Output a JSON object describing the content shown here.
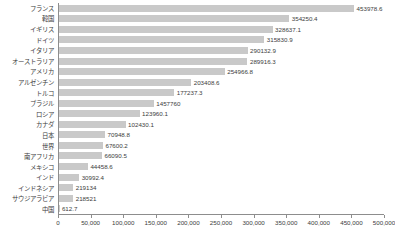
{
  "chart_data": {
    "type": "bar",
    "orientation": "horizontal",
    "title": "",
    "subtitle": "",
    "xlabel": "",
    "ylabel": "",
    "xlim": [
      0,
      500000
    ],
    "grid": false,
    "legend": null,
    "bar_color": "#c9c9c9",
    "axis_color": "#8d8d8d",
    "text_color": "#3c3c3c",
    "xticks": [
      0,
      50000,
      100000,
      150000,
      200000,
      250000,
      300000,
      350000,
      400000,
      450000,
      500000
    ],
    "xtick_labels": [
      "0",
      "50,000",
      "100,000",
      "150,000",
      "200,000",
      "250,000",
      "300,000",
      "350,000",
      "400,000",
      "450,000",
      "500,000"
    ],
    "categories": [
      "フランス",
      "韓国",
      "イギリス",
      "ドイツ",
      "イタリア",
      "オーストラリア",
      "アメリカ",
      "アルゼンチン",
      "トルコ",
      "ブラジル",
      "ロシア",
      "カナダ",
      "日本",
      "世界",
      "南アフリカ",
      "メキシコ",
      "インド",
      "インドネシア",
      "サウジアラビア",
      "中国"
    ],
    "values": [
      453978.6,
      354250.4,
      328637.1,
      315830.9,
      290132.9,
      289916.3,
      254966.8,
      203408.6,
      177237.3,
      145776.0,
      123960.1,
      102430.1,
      70948.8,
      67600.2,
      66090.5,
      44458.6,
      30992.4,
      21913.4,
      21852.1,
      612.7
    ],
    "value_labels": [
      "453978.6",
      "354250.4",
      "328637.1",
      "315830.9",
      "290132.9",
      "289916.3",
      "254966.8",
      "203408.6",
      "177237.3",
      "1457760",
      "123960.1",
      "102430.1",
      "70948.8",
      "67600.2",
      "66090.5",
      "44458.6",
      "30992.4",
      "219134",
      "218521",
      "612.7"
    ]
  }
}
